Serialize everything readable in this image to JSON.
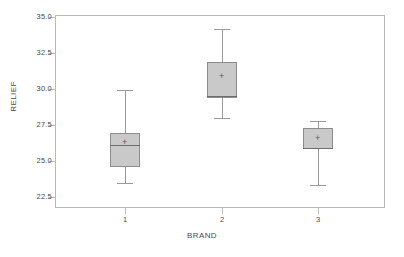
{
  "chart_data": {
    "type": "box",
    "title": "",
    "xlabel": "BRAND",
    "ylabel": "RELIEF",
    "categories": [
      "1",
      "2",
      "3"
    ],
    "ylim": [
      22.5,
      35.0
    ],
    "yticks": [
      "35.0",
      "32.5",
      "30.0",
      "27.5",
      "25.0",
      "22.5"
    ],
    "ytick_values": [
      35.0,
      32.5,
      30.0,
      27.5,
      25.0,
      22.5
    ],
    "xticks": [
      "1",
      "2",
      "3"
    ],
    "grid": false,
    "legend": "none",
    "box_fill_color": "#c9c9c9",
    "box_edge_color": "#8c8c8c",
    "mean_marker": "+",
    "boxes": [
      {
        "category": "1",
        "whisker_low": 23.5,
        "q1": 24.6,
        "median": 26.1,
        "mean": 26.25,
        "q3": 26.95,
        "whisker_high": 29.9
      },
      {
        "category": "2",
        "whisker_low": 28.0,
        "q1": 29.4,
        "median": 29.5,
        "mean": 30.85,
        "q3": 31.9,
        "whisker_high": 34.2
      },
      {
        "category": "3",
        "whisker_low": 23.3,
        "q1": 25.8,
        "median": 25.9,
        "mean": 26.55,
        "q3": 27.3,
        "whisker_high": 27.8
      }
    ]
  }
}
